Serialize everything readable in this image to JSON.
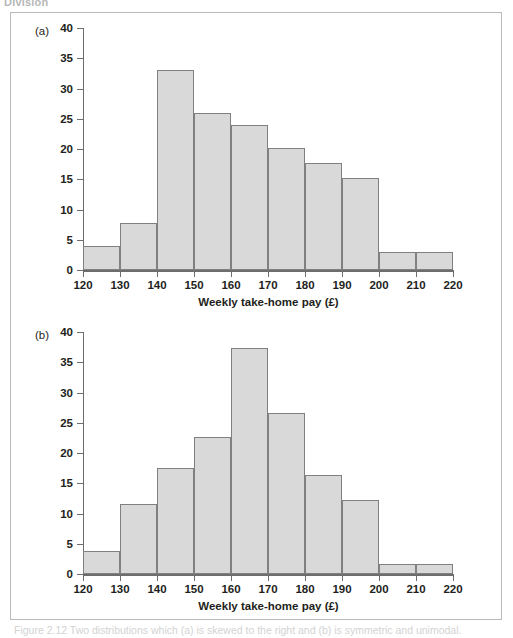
{
  "figure": {
    "top_cut_text": "Division",
    "bottom_caption_cut": "Figure 2.12  Two distributions which (a) is skewed to the right and (b) is symmetric and unimodal."
  },
  "panels": [
    {
      "label": "(a)",
      "chart_data": {
        "type": "bar",
        "title": "",
        "subtitle": "",
        "xlabel": "Weekly take-home pay (£)",
        "ylabel": "",
        "xlim": [
          120,
          220
        ],
        "ylim": [
          0,
          40
        ],
        "xticks": [
          120,
          130,
          140,
          150,
          160,
          170,
          180,
          190,
          200,
          210,
          220
        ],
        "yticks": [
          0,
          5,
          10,
          15,
          20,
          25,
          30,
          35,
          40
        ],
        "grid": false,
        "legend": "none",
        "bin_width": 10,
        "categories": [
          "120-130",
          "130-140",
          "140-150",
          "150-160",
          "160-170",
          "170-180",
          "180-190",
          "190-200",
          "200-210",
          "210-220"
        ],
        "bin_edges": [
          120,
          130,
          140,
          150,
          160,
          170,
          180,
          190,
          200,
          210,
          220
        ],
        "values": [
          3.9,
          7.7,
          33.0,
          26.0,
          23.9,
          20.2,
          17.7,
          15.2,
          3.0,
          3.0
        ]
      }
    },
    {
      "label": "(b)",
      "chart_data": {
        "type": "bar",
        "title": "",
        "subtitle": "",
        "xlabel": "Weekly take-home pay (£)",
        "ylabel": "",
        "xlim": [
          120,
          220
        ],
        "ylim": [
          0,
          40
        ],
        "xticks": [
          120,
          130,
          140,
          150,
          160,
          170,
          180,
          190,
          200,
          210,
          220
        ],
        "yticks": [
          0,
          5,
          10,
          15,
          20,
          25,
          30,
          35,
          40
        ],
        "grid": false,
        "legend": "none",
        "bin_width": 10,
        "categories": [
          "120-130",
          "130-140",
          "140-150",
          "150-160",
          "160-170",
          "170-180",
          "180-190",
          "190-200",
          "200-210",
          "210-220"
        ],
        "bin_edges": [
          120,
          130,
          140,
          150,
          160,
          170,
          180,
          190,
          200,
          210,
          220
        ],
        "values": [
          3.8,
          11.6,
          17.6,
          22.7,
          37.3,
          26.6,
          16.4,
          12.3,
          1.7,
          1.7
        ]
      }
    }
  ],
  "colors": {
    "bar_fill": "#d9d9d9",
    "bar_stroke": "#808080",
    "axis": "#6d6d6d",
    "text": "#231f20",
    "frame": "#b9b9b9"
  }
}
